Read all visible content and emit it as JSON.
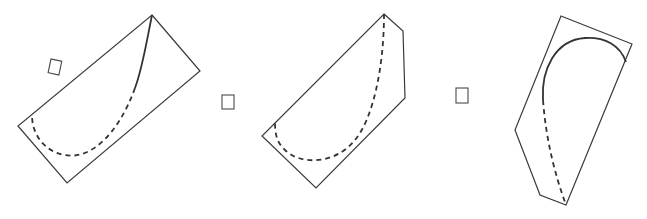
{
  "figure": {
    "colors": {
      "line": "#3a3a3a",
      "background": "#ffffff"
    },
    "options": [
      {
        "id": "A",
        "shape": "rectangle",
        "curve": "solid upper arc continuing as dashed lower arc",
        "answer_box": ""
      },
      {
        "id": "B",
        "shape": "pentagon (rectangle with clipped corner)",
        "curve": "fully dashed arc",
        "answer_box": ""
      },
      {
        "id": "C",
        "shape": "pentagon",
        "curve": "solid upper arc continuing as dashed line",
        "answer_box": ""
      }
    ]
  }
}
